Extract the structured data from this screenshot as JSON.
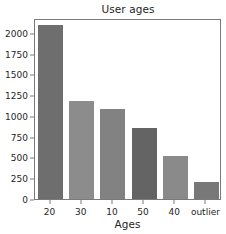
{
  "figure": {
    "background": "#ffffff",
    "frame_color": "#7a7a7a",
    "text_color": "#262626"
  },
  "chart_data": {
    "type": "bar",
    "title": "User ages",
    "xlabel": "Ages",
    "ylabel": "",
    "categories": [
      "20",
      "30",
      "10",
      "50",
      "40",
      "outlier"
    ],
    "values": [
      2090,
      1180,
      1090,
      860,
      520,
      200
    ],
    "bar_colors": [
      "#6e6e6e",
      "#8c8c8c",
      "#828282",
      "#646464",
      "#8a8a8a",
      "#787878"
    ],
    "ylim": [
      0,
      2180
    ],
    "yticks": [
      0,
      250,
      500,
      750,
      1000,
      1250,
      1500,
      1750,
      2000
    ],
    "ytick_labels": [
      "0",
      "250",
      "500",
      "750",
      "1000",
      "1250",
      "1500",
      "1750",
      "2000"
    ],
    "xtick_labels": [
      "20",
      "30",
      "10",
      "50",
      "40",
      "outlier"
    ],
    "grid": false,
    "legend": false
  }
}
